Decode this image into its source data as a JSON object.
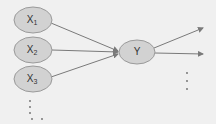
{
  "diagram": {
    "type": "neural-network-like node graph",
    "colors": {
      "background": "#f0f0f0",
      "node_fill": "#d2d2d2",
      "node_stroke": "#9a9a9a",
      "edge": "#7a7a7a",
      "text": "#333333",
      "dots": "#6a6a6a"
    },
    "input_nodes": [
      {
        "id": "x1",
        "label": "X",
        "subscript": "1",
        "cx": 33,
        "cy": 20
      },
      {
        "id": "x2",
        "label": "X",
        "subscript": "2",
        "cx": 33,
        "cy": 50
      },
      {
        "id": "x3",
        "label": "X",
        "subscript": "3",
        "cx": 33,
        "cy": 79
      }
    ],
    "output_node": {
      "id": "y",
      "label": "Y",
      "cx": 137,
      "cy": 52
    },
    "edges": [
      {
        "from": "x1",
        "to": "y"
      },
      {
        "from": "x2",
        "to": "y"
      },
      {
        "from": "x3",
        "to": "y"
      }
    ],
    "outgoing_arrows": [
      {
        "from": "y",
        "to_x": 203,
        "to_y": 28
      },
      {
        "from": "y",
        "to_x": 203,
        "to_y": 54
      }
    ],
    "ellipsis_marks": {
      "inputs": "vertical dots below X3",
      "outputs": "vertical dots below outgoing arrows"
    }
  }
}
